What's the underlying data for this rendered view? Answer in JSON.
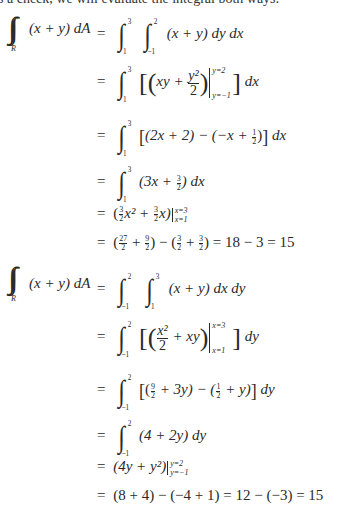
{
  "intro_text": "s a check, we will evaluate the integral both ways:",
  "first_order": {
    "lhs": "(x + y) dA",
    "region": "R",
    "equals": "=",
    "setup": {
      "outer_lower": "1",
      "outer_upper": "3",
      "inner_lower": "−1",
      "inner_upper": "2",
      "integrand": "(x + y) dy dx"
    },
    "step2": {
      "lower": "1",
      "upper": "3",
      "inner": "xy + ",
      "num": "y²",
      "den": "2",
      "eval_upper": "y=2",
      "eval_lower": "y=−1",
      "diff": "dx"
    },
    "step3": {
      "lower": "1",
      "upper": "3",
      "text_a": "(2x + 2) − (−x + ",
      "half_num": "1",
      "half_den": "2",
      "text_b": ")",
      "diff": "dx"
    },
    "step4": {
      "lower": "1",
      "upper": "3",
      "text_a": "(3x + ",
      "num": "3",
      "den": "2",
      "text_b": ") dx"
    },
    "step5": {
      "text": "x² + ",
      "c1_num": "3",
      "c1_den": "2",
      "c2_num": "3",
      "c2_den": "2",
      "tail": "x)",
      "eval_upper": "x=3",
      "eval_lower": "x=1"
    },
    "step6": {
      "f1_num": "27",
      "f1_den": "2",
      "f2_num": "9",
      "f2_den": "2",
      "f3_num": "3",
      "f3_den": "2",
      "f4_num": "3",
      "f4_den": "2",
      "result": "= 18 − 3 = 15"
    }
  },
  "second_order": {
    "lhs": "(x + y) dA",
    "region": "R",
    "equals": "=",
    "setup": {
      "outer_lower": "−1",
      "outer_upper": "2",
      "inner_lower": "1",
      "inner_upper": "3",
      "integrand": "(x + y) dx dy"
    },
    "step2": {
      "lower": "−1",
      "upper": "2",
      "num": "x²",
      "den": "2",
      "inner": " + xy",
      "eval_upper": "x=3",
      "eval_lower": "x=1",
      "diff": "dy"
    },
    "step3": {
      "lower": "−1",
      "upper": "2",
      "f1_num": "9",
      "f1_den": "2",
      "text_a": " + 3y) − (",
      "f2_num": "1",
      "f2_den": "2",
      "text_b": " + y)",
      "diff": "dy"
    },
    "step4": {
      "lower": "−1",
      "upper": "2",
      "text": "(4 + 2y) dy"
    },
    "step5": {
      "text": "(4y + y²)",
      "eval_upper": "y=2",
      "eval_lower": "y=−1"
    },
    "step6": {
      "text": "(8 + 4) − (−4 + 1) = 12 − (−3) = 15"
    }
  }
}
